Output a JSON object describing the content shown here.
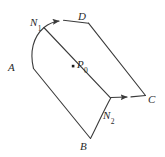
{
  "figure": {
    "name": "curved-surface-patch",
    "background_color": "#ffffff",
    "stroke_color": "#3a3a3a",
    "label_color": "#2a2a2a",
    "stroke_width": 1.1,
    "width": 165,
    "height": 157
  },
  "labels": {
    "corner_a": {
      "text": "A",
      "sub": ""
    },
    "corner_b": {
      "text": "B",
      "sub": ""
    },
    "corner_c": {
      "text": "C",
      "sub": ""
    },
    "corner_d": {
      "text": "D",
      "sub": ""
    },
    "normal_1": {
      "text": "N",
      "sub": "1"
    },
    "normal_2": {
      "text": "N",
      "sub": "2"
    },
    "point_p0": {
      "text": "P",
      "sub": "0"
    }
  },
  "geometry": {
    "corners": {
      "A": [
        33,
        68
      ],
      "B": [
        90,
        139
      ],
      "C": [
        145,
        96
      ],
      "D": [
        88,
        23
      ]
    },
    "interior_point": [
      73,
      66
    ],
    "arrow_1_tip": [
      62,
      21
    ],
    "arrow_2_tip": [
      129,
      97
    ]
  }
}
